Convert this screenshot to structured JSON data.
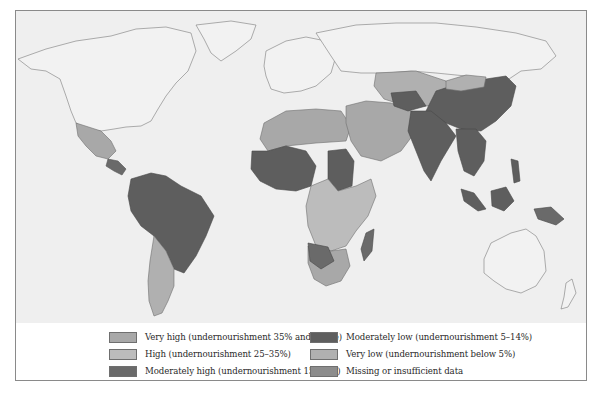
{
  "map": {
    "title": "",
    "type": "choropleth",
    "background": "#efefef",
    "categories": [
      {
        "key": "very_high",
        "label": "Very high (undernourishment 35% and above)",
        "color": "#a8a8a8"
      },
      {
        "key": "high",
        "label": "High (undernourishment 25–35%)",
        "color": "#bcbcbc"
      },
      {
        "key": "moderately_high",
        "label": "Moderately high (undernourishment 15–24%)",
        "color": "#6a6a6a"
      },
      {
        "key": "moderately_low",
        "label": "Moderately low (undernourishment 5–14%)",
        "color": "#5e5e5e"
      },
      {
        "key": "very_low",
        "label": "Very low (undernourishment below 5%)",
        "color": "#b0b0b0"
      },
      {
        "key": "missing",
        "label": "Missing or insufficient data",
        "color": "#8c8c8c"
      }
    ]
  },
  "legend": {
    "items": [
      {
        "label": "Very high (undernourishment 35% and above)",
        "color": "#a8a8a8"
      },
      {
        "label": "High (undernourishment 25–35%)",
        "color": "#bcbcbc"
      },
      {
        "label": "Moderately high (undernourishment 15–24%)",
        "color": "#6a6a6a"
      },
      {
        "label": "Moderately low (undernourishment 5–14%)",
        "color": "#5e5e5e"
      },
      {
        "label": "Very low (undernourishment below 5%)",
        "color": "#b0b0b0"
      },
      {
        "label": "Missing or insufficient data",
        "color": "#8c8c8c"
      }
    ]
  }
}
